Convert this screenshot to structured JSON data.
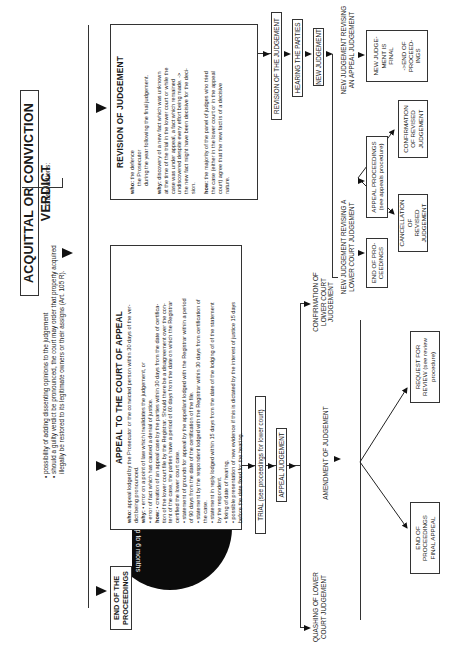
{
  "title": "ACQUITTAL OR CONVICTION VERDICT",
  "observations": {
    "label": "Observations:",
    "items": [
      "• possibility of adding dissenting opinions to the judgement",
      "• should a guilty verdict be pronounced, the court may order that property acquired",
      "   illegally be restored to its legitimate owners or their assigns (Art. 105 R)."
    ]
  },
  "end_of_proceedings": {
    "line1": "END OF THE",
    "line2": "PROCEEDINGS"
  },
  "time_limit": "Up to 6 months",
  "appeal": {
    "heading": "APPEAL TO THE COURT OF APPEAL",
    "lines": [
      {
        "k": "who:",
        "t": " appeal lodged by the Prosecutor or the convicted person within 30 days of the ver-"
      },
      {
        "k": "",
        "t": "dict being pronounced."
      },
      {
        "k": "why:",
        "t": " • error on a point of law which invalidates the judgement, or"
      },
      {
        "k": "",
        "t": "• error of fact which has caused a denial of justice."
      },
      {
        "k": "how:",
        "t": " • creation of an appeal case by the parties within 30 days from the date of certifica-"
      },
      {
        "k": "",
        "t": "tion of the lower court file by the Registrar.  Should there be a disagreement over  the con-"
      },
      {
        "k": "",
        "t": "tent of the case, the parties have a period of 60 days from the date on which the Registrar"
      },
      {
        "k": "",
        "t": "certified the lower court case."
      },
      {
        "k": "",
        "t": "• statement of grounds for appeal by the appellant lodged with the Registrar within a period"
      },
      {
        "k": "",
        "t": "of 90 days from the date of the certification of the file."
      },
      {
        "k": "",
        "t": "• statement by the respondent lodged with the Registrar within 30 days from certification of"
      },
      {
        "k": "",
        "t": "the case."
      },
      {
        "k": "",
        "t": "• statement in reply lodged within 15 days from the date of the lodging of of the statement"
      },
      {
        "k": "",
        "t": "by the respondent."
      },
      {
        "k": "",
        "t": "• fixing of date of hearing."
      },
      {
        "k": "",
        "t": "• possible presentation of new evidence if this is dictated by the interest of justice 15 days"
      },
      {
        "k": "",
        "t": "before the date fixed for the hearing."
      }
    ]
  },
  "revision": {
    "heading": "REVISION OF JUDGEMENT",
    "who_label": "who:",
    "who": [
      "the defence",
      "the Prosecutor",
      "during the year following the final judgement."
    ],
    "why_label": "why:",
    "why": [
      " discovery of a new fact which was unknown",
      "at the time of the trial in the lower court or while the",
      "case was under appeal, a fact which remained",
      "undiscovered despite every effort being made. ->",
      "the new fact might have been decisive for the deci-",
      "sion."
    ],
    "how_label": "how:",
    "how": [
      " the majority of the panel of judges who tried",
      "the case (either in the lower court or in the appeal",
      "court) agree that the new fact is of a decisive",
      "nature."
    ]
  },
  "appeal_steps": {
    "trial": "TRIAL (see proceedings for lower court)",
    "appeal_judgement": "APPEAL JUDGEMENT"
  },
  "revision_steps": {
    "revision": "REVISION OF THE JUDGEMENT",
    "hearing": "HEARING THE PARTIES",
    "new_judgement": "NEW JUDGEMENT"
  },
  "outcomes": {
    "quashing": [
      "QUASHING OF LOWER",
      "COURT JUDGEMENT"
    ],
    "amendment": [
      "AMENDMENT OF JUDGEMENT"
    ],
    "confirmation": [
      "CONFIRMATION OF",
      "LOWER COURT",
      "JUDGEMENT"
    ],
    "end_final_appeal": [
      "END OF",
      "PROCEEDINGS",
      "FINAL APPEAL"
    ],
    "request_review": [
      "REQUEST FOR",
      "REVIEW (see review",
      "procedure)"
    ]
  },
  "revision_outcomes": {
    "revising_lower": [
      "NEW JUDGEMENT REVISING A",
      "LOWER COURT JUDGEMENT"
    ],
    "revising_appeal": [
      "NEW JUDGEMENT REVISING",
      "AN APPEAL JUDGEMENT"
    ],
    "end_pro": [
      "END OF PRO-",
      "CEEDINGS"
    ],
    "appeal_proceedings": [
      "APPEAL PROCEEDINGS",
      "(see appeals procedure)"
    ],
    "cancellation": [
      "CANCELLATION OF",
      "REVISED",
      "JUDGEMENT"
    ],
    "confirmation_revised": [
      "CONFIRMATION",
      "OF REVISED",
      "JUDGEMENT"
    ],
    "final": [
      "NEW JUDGE-",
      "MENT IS",
      "FINAL",
      "",
      "->END OF",
      "PROCEED-",
      "INGS"
    ]
  }
}
